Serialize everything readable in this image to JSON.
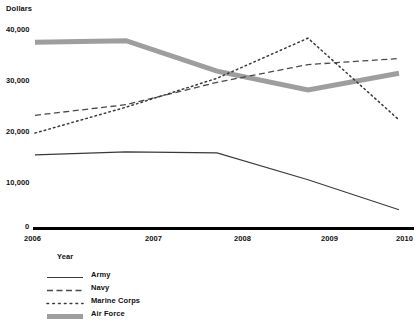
{
  "chart_data": {
    "type": "line",
    "title": "",
    "subtitle": "",
    "xlabel": "Year",
    "ylabel": "Dollars",
    "x": [
      2006,
      2007,
      2008,
      2009,
      2010
    ],
    "categories": [
      "2006",
      "2007",
      "2008",
      "2009",
      "2010"
    ],
    "xtick_labels": [
      "2006",
      "2007",
      "2008",
      "2009",
      "2010"
    ],
    "ytick_labels": [
      "0",
      "10,000",
      "20,000",
      "30,000",
      "40,000"
    ],
    "ytick_values": [
      0,
      10000,
      20000,
      30000,
      40000
    ],
    "ylim": [
      0,
      40000
    ],
    "xlim": [
      2006,
      2010
    ],
    "grid": false,
    "legend_position": "below",
    "series": [
      {
        "name": "Army",
        "style": "solid-thin",
        "color": "#3a3a3a",
        "values": [
          14500,
          15100,
          14900,
          9600,
          3700
        ]
      },
      {
        "name": "Navy",
        "style": "dashed",
        "color": "#4a4a4a",
        "values": [
          22300,
          24400,
          28800,
          32300,
          33500
        ]
      },
      {
        "name": "Marine Corps",
        "style": "dotted",
        "color": "#3a3a3a",
        "values": [
          18800,
          23900,
          29600,
          37500,
          21400
        ]
      },
      {
        "name": "Air Force",
        "style": "thick-gray",
        "color": "#9e9e9e",
        "values": [
          36700,
          37000,
          31000,
          27300,
          30600
        ]
      }
    ],
    "legend_entries": [
      {
        "label": "Army",
        "style": "solid-thin",
        "color": "#3a3a3a"
      },
      {
        "label": "Navy",
        "style": "dashed",
        "color": "#4a4a4a"
      },
      {
        "label": "Marine Corps",
        "style": "dotted",
        "color": "#3a3a3a"
      },
      {
        "label": "Air Force",
        "style": "thick-gray",
        "color": "#9e9e9e"
      }
    ],
    "axis_color": "#000000"
  }
}
